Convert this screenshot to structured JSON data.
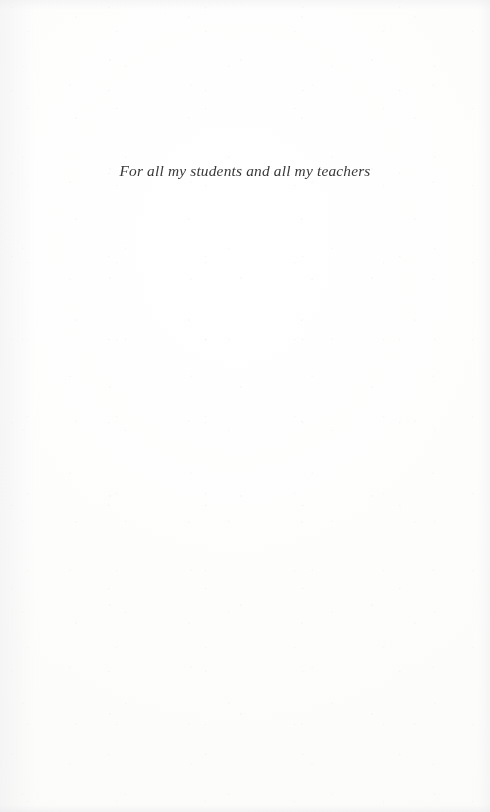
{
  "page": {
    "kind": "book-dedication-page",
    "paper_color": "#fdfdfc",
    "ink_color": "#2a2a2a"
  },
  "dedication": {
    "text": "For all my students and all my teachers"
  }
}
